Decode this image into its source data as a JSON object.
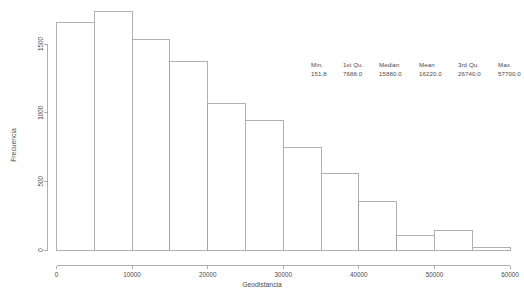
{
  "chart_data": {
    "type": "bar",
    "title": "",
    "subtitle": "",
    "xlabel": "Geodistancia",
    "ylabel": "Frecuencia",
    "xlim": [
      0,
      60000
    ],
    "ylim": [
      0,
      1700
    ],
    "grid": false,
    "legend": null,
    "bin_width": 5000,
    "xticks": [
      0,
      10000,
      20000,
      30000,
      40000,
      50000,
      60000
    ],
    "xtick_labels": [
      "0",
      "10000",
      "20000",
      "30000",
      "40000",
      "50000",
      "60000"
    ],
    "yticks": [
      0,
      500,
      1000,
      1500
    ],
    "ytick_labels": [
      "0",
      "500",
      "1000",
      "1500"
    ],
    "bins": [
      {
        "x0": 0,
        "x1": 5000,
        "value": 1655
      },
      {
        "x0": 5000,
        "x1": 10000,
        "value": 1740
      },
      {
        "x0": 10000,
        "x1": 15000,
        "value": 1530
      },
      {
        "x0": 15000,
        "x1": 20000,
        "value": 1375
      },
      {
        "x0": 20000,
        "x1": 25000,
        "value": 1070
      },
      {
        "x0": 25000,
        "x1": 30000,
        "value": 940
      },
      {
        "x0": 30000,
        "x1": 35000,
        "value": 750
      },
      {
        "x0": 35000,
        "x1": 40000,
        "value": 560
      },
      {
        "x0": 40000,
        "x1": 45000,
        "value": 355
      },
      {
        "x0": 45000,
        "x1": 50000,
        "value": 105
      },
      {
        "x0": 50000,
        "x1": 55000,
        "value": 145
      },
      {
        "x0": 55000,
        "x1": 60000,
        "value": 20
      }
    ],
    "categories": [
      "0-5000",
      "5000-10000",
      "10000-15000",
      "15000-20000",
      "20000-25000",
      "25000-30000",
      "30000-35000",
      "35000-40000",
      "40000-45000",
      "45000-50000",
      "50000-55000",
      "55000-60000"
    ],
    "values": [
      1655,
      1740,
      1530,
      1375,
      1070,
      940,
      750,
      560,
      355,
      105,
      145,
      20
    ]
  },
  "annotation": {
    "headers": [
      "Min.",
      "1st Qu.",
      "Median",
      "Mean",
      "3rd Qu.",
      "Max."
    ],
    "values": [
      "151.8",
      "7688.0",
      "15880.0",
      "16220.0",
      "26740.0",
      "57700.0"
    ]
  },
  "colors": {
    "bar_fill": "#ffffff",
    "bar_stroke": "#9e9e9e",
    "axis": "#9b9b9b",
    "text": "#4a4a4a",
    "background": "#ffffff"
  }
}
